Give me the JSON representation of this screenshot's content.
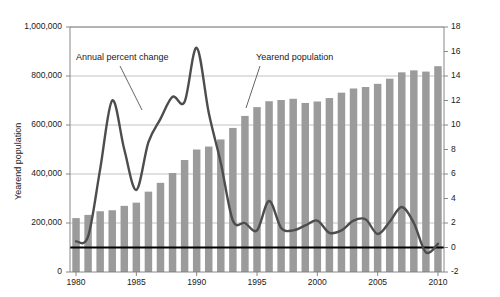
{
  "chart_data": {
    "type": "bar",
    "title": "",
    "xlabel": "",
    "ylabel": "Yearend population",
    "ylabel_right": "",
    "grid": true,
    "legend": "annotations",
    "x": [
      1980,
      1981,
      1982,
      1983,
      1984,
      1985,
      1986,
      1987,
      1988,
      1989,
      1990,
      1991,
      1992,
      1993,
      1994,
      1995,
      1996,
      1997,
      1998,
      1999,
      2000,
      2001,
      2002,
      2003,
      2004,
      2005,
      2006,
      2007,
      2008,
      2009,
      2010
    ],
    "xlim": [
      1979.5,
      2010.5
    ],
    "xticks": [
      1980,
      1985,
      1990,
      1995,
      2000,
      2005,
      2010
    ],
    "xticklabels": [
      "1980",
      "1985",
      "1990",
      "1995",
      "2000",
      "2005",
      "2010"
    ],
    "ylim": [
      0,
      1000000
    ],
    "yticks": [
      0,
      200000,
      400000,
      600000,
      800000,
      1000000
    ],
    "yticklabels": [
      "0",
      "200,000",
      "400,000",
      "600,000",
      "800,000",
      "1,000,000"
    ],
    "ylim_right": [
      -2,
      18
    ],
    "yticks_right": [
      -2,
      0,
      2,
      4,
      6,
      8,
      10,
      12,
      14,
      16,
      18
    ],
    "yticklabels_right": [
      "-2",
      "0",
      "2",
      "4",
      "6",
      "8",
      "10",
      "12",
      "14",
      "16",
      "18"
    ],
    "series": [
      {
        "name": "Yearend population",
        "type": "bar",
        "axis": "left",
        "color": "#9b9b9b",
        "values": [
          220000,
          233000,
          248000,
          252000,
          270000,
          283000,
          328000,
          364000,
          404000,
          457000,
          500000,
          512000,
          541000,
          588000,
          637000,
          673000,
          697000,
          702000,
          707000,
          690000,
          696000,
          710000,
          732000,
          749000,
          755000,
          768000,
          789000,
          815000,
          823000,
          818000,
          840000
        ]
      },
      {
        "name": "Annual percent change",
        "type": "line",
        "axis": "right",
        "color": "#4d4d4d",
        "values": [
          0.5,
          0.9,
          6.4,
          12.0,
          8.0,
          4.7,
          8.6,
          10.5,
          12.3,
          11.9,
          16.3,
          11.0,
          6.9,
          2.2,
          2.0,
          1.4,
          3.8,
          1.6,
          1.4,
          1.8,
          2.2,
          1.2,
          1.4,
          2.2,
          2.3,
          1.1,
          2.1,
          3.3,
          2.0,
          -0.4,
          0.3
        ]
      }
    ],
    "zero_line": {
      "value": 0,
      "axis": "right",
      "color": "#000000"
    },
    "annotations": [
      {
        "id": "annual-percent-change",
        "text": "Annual percent change",
        "x": 76,
        "y": 52,
        "leader": {
          "x1": 120,
          "y1": 66,
          "x2": 142,
          "y2": 110
        }
      },
      {
        "id": "yearend-population",
        "text": "Yearend population",
        "x": 256,
        "y": 52,
        "leader": {
          "x1": 260,
          "y1": 66,
          "x2": 246,
          "y2": 108
        }
      }
    ]
  }
}
